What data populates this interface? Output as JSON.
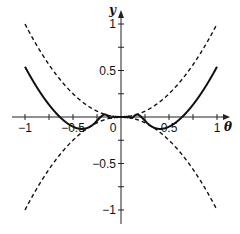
{
  "chart_data": {
    "type": "line",
    "title": "",
    "xlabel": "θ",
    "ylabel": "y",
    "xlim": [
      -1,
      1
    ],
    "ylim": [
      -1,
      1
    ],
    "grid": false,
    "legend": null,
    "x_ticks": [
      -1,
      -0.5,
      0,
      0.5,
      1
    ],
    "x_tick_labels": [
      "−1",
      "−0.5",
      "0",
      "0.5",
      "1"
    ],
    "y_ticks": [
      -1,
      -0.5,
      0.5,
      1
    ],
    "y_tick_labels": [
      "−1",
      "−0.5",
      "0.5",
      "1"
    ],
    "series": [
      {
        "name": "y = θ² cos(1/θ)",
        "style": "solid",
        "x": [
          -1,
          -0.8,
          -0.637,
          -0.5,
          -0.4,
          -0.318,
          -0.25,
          -0.2,
          -0.1,
          0,
          0.1,
          0.2,
          0.25,
          0.318,
          0.4,
          0.5,
          0.637,
          0.8,
          1
        ],
        "values": [
          0.54,
          0.2,
          0.0,
          -0.1,
          -0.13,
          -0.1,
          -0.04,
          0.01,
          -0.01,
          0,
          -0.01,
          0.01,
          -0.04,
          -0.1,
          -0.13,
          -0.1,
          0.0,
          0.2,
          0.54
        ]
      },
      {
        "name": "y = θ²",
        "style": "dashed",
        "x": [
          -1,
          -0.5,
          0,
          0.5,
          1
        ],
        "values": [
          1,
          0.25,
          0,
          0.25,
          1
        ]
      },
      {
        "name": "y = −θ²",
        "style": "dashed",
        "x": [
          -1,
          -0.5,
          0,
          0.5,
          1
        ],
        "values": [
          -1,
          -0.25,
          0,
          -0.25,
          -1
        ]
      }
    ]
  },
  "labels": {
    "x_axis": "θ",
    "y_axis": "y"
  }
}
